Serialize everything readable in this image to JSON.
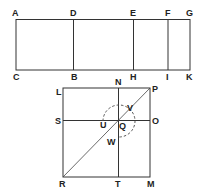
{
  "diagram": {
    "top_figure": {
      "labels": {
        "A": "A",
        "D": "D",
        "E": "E",
        "F": "F",
        "G": "G",
        "C": "C",
        "B": "B",
        "H": "H",
        "I": "I",
        "K": "K"
      }
    },
    "bottom_figure": {
      "labels": {
        "L": "L",
        "N": "N",
        "P": "P",
        "S": "S",
        "U": "U",
        "Q": "Q",
        "V": "V",
        "O": "O",
        "W": "W",
        "R": "R",
        "T": "T",
        "M": "M"
      }
    },
    "colors": {
      "line": "#333333",
      "background": "#ffffff"
    }
  }
}
